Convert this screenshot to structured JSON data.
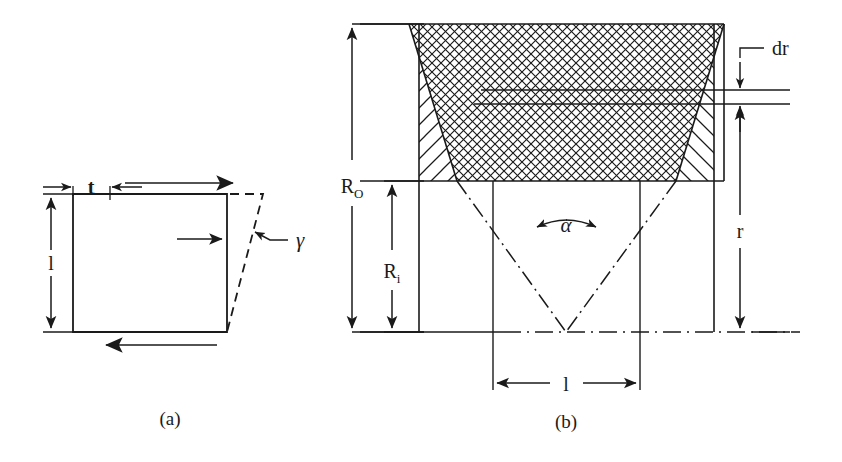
{
  "figure": {
    "kind": "technical-line-diagram",
    "panels": [
      {
        "id": "a",
        "caption": "(a)",
        "labels": {
          "thickness": "t",
          "length": "l",
          "shear_angle": "γ"
        },
        "annotations": [
          "top shear arrow pointing right",
          "bottom shear arrow pointing left",
          "interior arrow pointing right",
          "leader arrow from gamma to sheared edge"
        ]
      },
      {
        "id": "b",
        "caption": "(b)",
        "labels": {
          "outer_radius": "R",
          "outer_radius_sub": "O",
          "inner_radius": "R",
          "inner_radius_sub": "i",
          "element_thickness": "dr",
          "radius": "r",
          "cone_angle": "α",
          "length": "l"
        },
        "annotations": [
          "cross-hatched central trapezoid",
          "diagonally hatched left flank",
          "diagonally hatched right flank",
          "dash-dot centerline at bottom",
          "dash-dot V converging to apex"
        ]
      }
    ],
    "colors": {
      "line": "#1a1a1a",
      "background": "#ffffff"
    }
  }
}
